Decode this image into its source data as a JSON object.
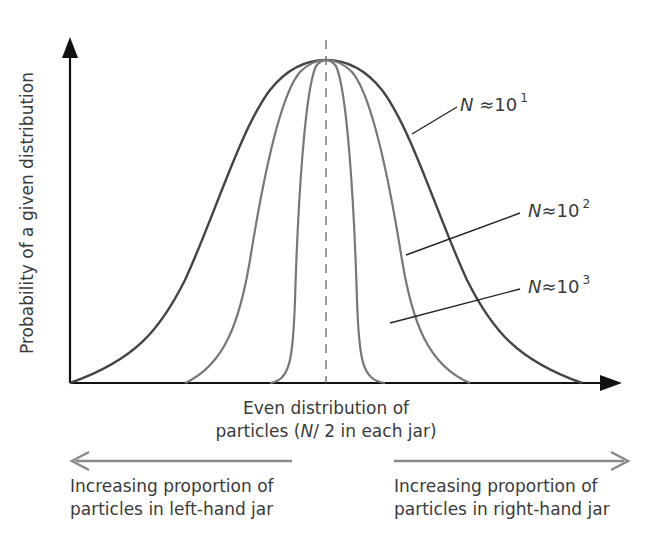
{
  "diagram": {
    "y_axis_label": "Probability of a given distribution",
    "x_axis_label_line1": "Even distribution of",
    "x_axis_label_line2_prefix": "particles (",
    "x_axis_label_line2_var": "N",
    "x_axis_label_line2_suffix": "/ 2 in each jar)",
    "curves": [
      {
        "var": "N",
        "approx": "≈10",
        "exp": "1",
        "color": "#444444",
        "width_label": "wide"
      },
      {
        "var": "N",
        "approx": "≈10",
        "exp": "2",
        "color": "#777777",
        "width_label": "medium"
      },
      {
        "var": "N",
        "approx": "≈10",
        "exp": "3",
        "color": "#777777",
        "width_label": "narrow"
      }
    ],
    "left_note_line1": "Increasing proportion of",
    "left_note_line2": "particles in left-hand jar",
    "right_note_line1": "Increasing proportion of",
    "right_note_line2": "particles in right-hand jar",
    "axis_color": "#111111",
    "arrow_color": "#8a8a8a"
  }
}
